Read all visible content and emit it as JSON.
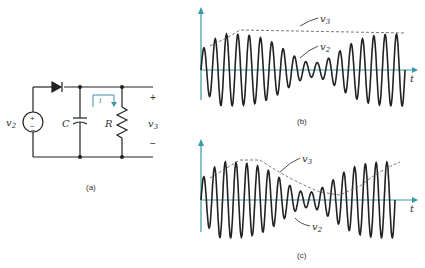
{
  "figure": {
    "panel_a": {
      "caption": "(a)",
      "source_label": "v",
      "source_sub": "2",
      "source_plus": "+",
      "source_minus": "−",
      "capacitor_label": "C",
      "resistor_label": "R",
      "current_label": "i",
      "output_label": "v",
      "output_sub": "3",
      "output_plus": "+",
      "output_minus": "−"
    },
    "panel_b": {
      "caption": "(b)",
      "envelope_label": "v",
      "envelope_sub": "3",
      "signal_label": "v",
      "signal_sub": "2",
      "time_axis": "t"
    },
    "panel_c": {
      "caption": "(c)",
      "envelope_label": "v",
      "envelope_sub": "3",
      "signal_label": "v",
      "signal_sub": "2",
      "time_axis": "t"
    },
    "colors": {
      "axis": "#3a9aa6",
      "wire": "#222222",
      "current_arrow": "#3a9aa6"
    }
  }
}
